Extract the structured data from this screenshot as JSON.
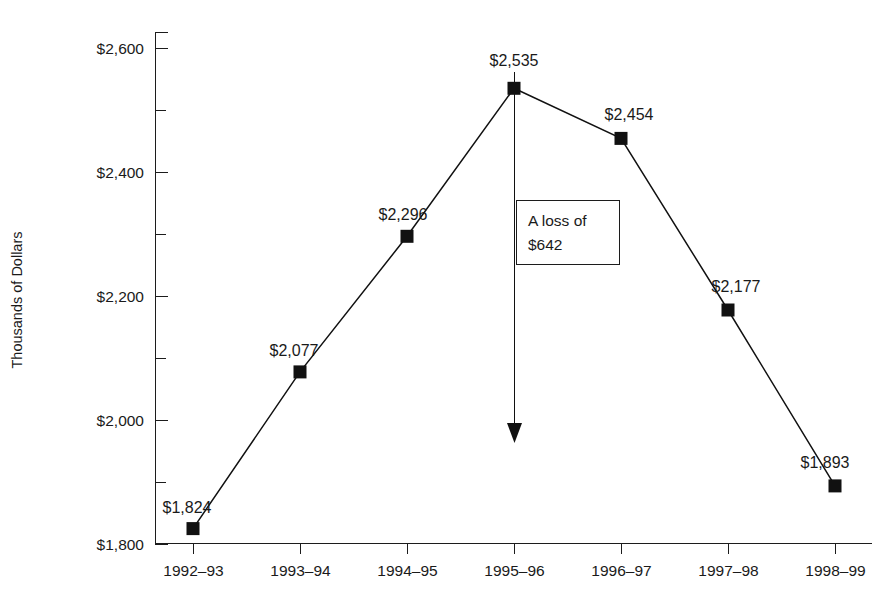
{
  "chart_data": {
    "type": "line",
    "title": "",
    "xlabel": "",
    "ylabel": "Thousands of Dollars",
    "categories": [
      "1992–93",
      "1993–94",
      "1994–95",
      "1995–96",
      "1996–97",
      "1997–98",
      "1998–99"
    ],
    "values": [
      1824,
      2077,
      2296,
      2535,
      2454,
      2177,
      1893
    ],
    "point_labels": [
      "$1,824",
      "$2,077",
      "$2,296",
      "$2,535",
      "$2,454",
      "$2,177",
      "$1,893"
    ],
    "ylim": [
      1800,
      2600
    ],
    "y_major_ticks": [
      1800,
      2000,
      2200,
      2400,
      2600
    ],
    "y_major_tick_labels": [
      "$1,800",
      "$2,000",
      "$2,200",
      "$2,400",
      "$2,600"
    ],
    "y_minor_ticks": [
      1900,
      2100,
      2300,
      2500
    ],
    "grid": false,
    "legend": false,
    "legend_position": "none",
    "marker": "filled-square",
    "line_color": "#111111",
    "marker_color": "#111111",
    "background_color": "#ffffff",
    "annotations": [
      {
        "id": "loss-callout",
        "text_line_1": "A loss of",
        "text_line_2": "$642",
        "from_value": 2535,
        "to_value": 1893,
        "at_category": "1995–96",
        "arrow": "down"
      }
    ]
  },
  "axis": {
    "y_title": "Thousands of Dollars"
  },
  "annotation_box": {
    "line1": "A loss of",
    "line2": "$642"
  }
}
